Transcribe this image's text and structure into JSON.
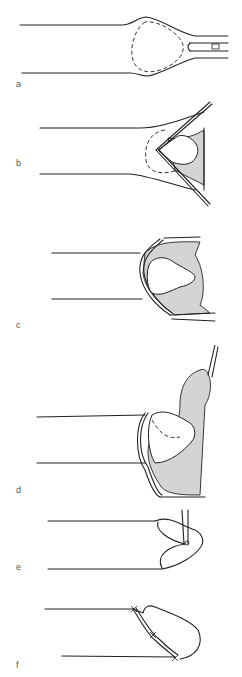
{
  "figure": {
    "panels": [
      {
        "id": "a",
        "label": "a"
      },
      {
        "id": "b",
        "label": "b"
      },
      {
        "id": "c",
        "label": "c"
      },
      {
        "id": "d",
        "label": "d"
      },
      {
        "id": "e",
        "label": "e"
      },
      {
        "id": "f",
        "label": "f"
      }
    ],
    "colors": {
      "line": "#222222",
      "shade": "#d4d4d4",
      "label": "#555555",
      "background": "#ffffff"
    }
  }
}
